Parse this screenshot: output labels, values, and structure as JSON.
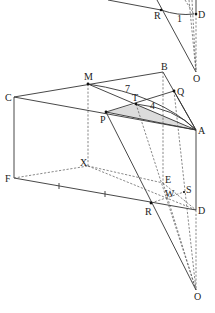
{
  "diagram": {
    "type": "3D geometric construction (prism with projection to point O)",
    "fill_color": "#dcdcdc",
    "line_color": "#333333",
    "top_fragment": {
      "labels": {
        "R": "R",
        "D": "D",
        "O": "O",
        "one": "1"
      }
    },
    "main_figure": {
      "labels": {
        "C": "C",
        "M": "M",
        "B": "B",
        "Q": "Q",
        "T": "T",
        "P": "P",
        "A": "A",
        "X": "X",
        "E": "E",
        "F": "F",
        "W": "W",
        "S": "S",
        "R": "R",
        "D": "D",
        "O": "O"
      },
      "measures": {
        "seven": "7",
        "four": "4"
      },
      "shaded_triangle": [
        "P",
        "T",
        "A"
      ]
    }
  }
}
